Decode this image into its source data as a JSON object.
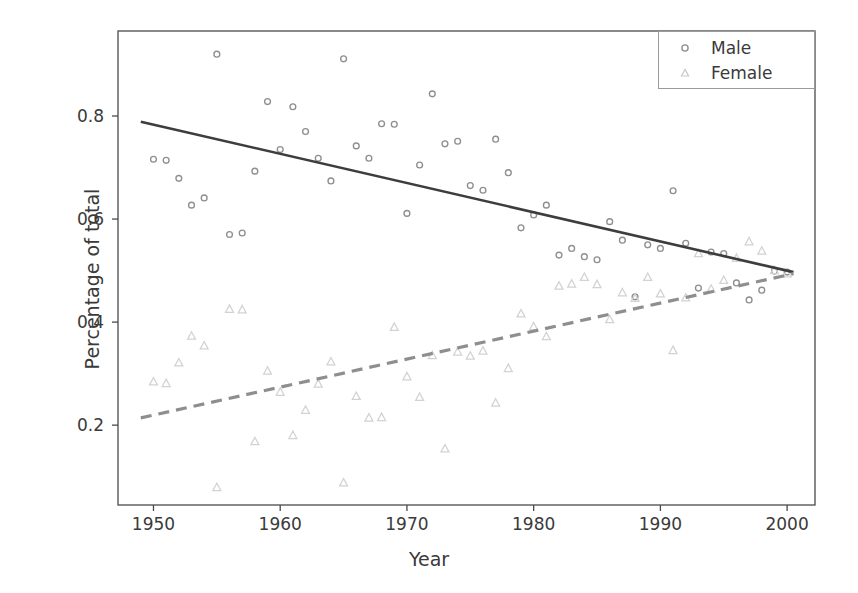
{
  "chart_data": {
    "type": "scatter",
    "title": "",
    "xlabel": "Year",
    "ylabel": "Percentage of total",
    "xlim": [
      1947.2,
      2002.2
    ],
    "ylim": [
      0.045,
      0.965
    ],
    "xticks": [
      1950,
      1960,
      1970,
      1980,
      1990,
      2000
    ],
    "xtick_labels": [
      "1950",
      "1960",
      "1970",
      "1980",
      "1990",
      "2000"
    ],
    "yticks": [
      0.2,
      0.4,
      0.6,
      0.8
    ],
    "ytick_labels": [
      "0.2",
      "0.4",
      "0.6",
      "0.8"
    ],
    "grid": false,
    "legend_position": "upper right",
    "series": [
      {
        "name": "Male",
        "marker": "circle-open",
        "marker_color": "#8e8e8e",
        "trend_style": "solid",
        "trend_color": "#3d3d3d",
        "trend_endpoints": [
          [
            1949.0,
            0.789
          ],
          [
            2000.5,
            0.497
          ]
        ],
        "points": [
          [
            1950,
            0.716
          ],
          [
            1951,
            0.714
          ],
          [
            1952,
            0.679
          ],
          [
            1953,
            0.627
          ],
          [
            1954,
            0.641
          ],
          [
            1955,
            0.92
          ],
          [
            1956,
            0.57
          ],
          [
            1957,
            0.573
          ],
          [
            1958,
            0.693
          ],
          [
            1959,
            0.828
          ],
          [
            1960,
            0.735
          ],
          [
            1961,
            0.818
          ],
          [
            1962,
            0.77
          ],
          [
            1963,
            0.718
          ],
          [
            1964,
            0.674
          ],
          [
            1965,
            0.911
          ],
          [
            1966,
            0.742
          ],
          [
            1967,
            0.718
          ],
          [
            1968,
            0.785
          ],
          [
            1969,
            0.784
          ],
          [
            1970,
            0.611
          ],
          [
            1971,
            0.705
          ],
          [
            1972,
            0.843
          ],
          [
            1973,
            0.746
          ],
          [
            1974,
            0.751
          ],
          [
            1975,
            0.665
          ],
          [
            1976,
            0.656
          ],
          [
            1977,
            0.755
          ],
          [
            1978,
            0.69
          ],
          [
            1979,
            0.583
          ],
          [
            1980,
            0.608
          ],
          [
            1981,
            0.627
          ],
          [
            1982,
            0.53
          ],
          [
            1983,
            0.543
          ],
          [
            1984,
            0.527
          ],
          [
            1985,
            0.521
          ],
          [
            1986,
            0.595
          ],
          [
            1987,
            0.559
          ],
          [
            1988,
            0.449
          ],
          [
            1989,
            0.55
          ],
          [
            1990,
            0.543
          ],
          [
            1991,
            0.655
          ],
          [
            1992,
            0.553
          ],
          [
            1993,
            0.466
          ],
          [
            1994,
            0.536
          ],
          [
            1995,
            0.533
          ],
          [
            1996,
            0.476
          ],
          [
            1997,
            0.443
          ],
          [
            1998,
            0.462
          ],
          [
            1999,
            0.499
          ],
          [
            2000,
            0.497
          ]
        ]
      },
      {
        "name": "Female",
        "marker": "triangle-open",
        "marker_color": "#d2d2d2",
        "trend_style": "dashed",
        "trend_color": "#8e8e8e",
        "trend_endpoints": [
          [
            1949.0,
            0.214
          ],
          [
            2000.5,
            0.494
          ]
        ],
        "points": [
          [
            1950,
            0.284
          ],
          [
            1951,
            0.281
          ],
          [
            1952,
            0.321
          ],
          [
            1953,
            0.373
          ],
          [
            1954,
            0.354
          ],
          [
            1955,
            0.079
          ],
          [
            1956,
            0.425
          ],
          [
            1957,
            0.424
          ],
          [
            1958,
            0.168
          ],
          [
            1959,
            0.305
          ],
          [
            1960,
            0.264
          ],
          [
            1961,
            0.18
          ],
          [
            1962,
            0.229
          ],
          [
            1963,
            0.28
          ],
          [
            1964,
            0.323
          ],
          [
            1965,
            0.088
          ],
          [
            1966,
            0.256
          ],
          [
            1967,
            0.214
          ],
          [
            1968,
            0.215
          ],
          [
            1969,
            0.39
          ],
          [
            1970,
            0.294
          ],
          [
            1971,
            0.254
          ],
          [
            1972,
            0.335
          ],
          [
            1973,
            0.154
          ],
          [
            1974,
            0.342
          ],
          [
            1975,
            0.334
          ],
          [
            1976,
            0.344
          ],
          [
            1977,
            0.243
          ],
          [
            1978,
            0.31
          ],
          [
            1979,
            0.416
          ],
          [
            1980,
            0.391
          ],
          [
            1981,
            0.372
          ],
          [
            1982,
            0.47
          ],
          [
            1983,
            0.474
          ],
          [
            1984,
            0.487
          ],
          [
            1985,
            0.473
          ],
          [
            1986,
            0.405
          ],
          [
            1987,
            0.457
          ],
          [
            1988,
            0.446
          ],
          [
            1989,
            0.487
          ],
          [
            1990,
            0.455
          ],
          [
            1991,
            0.345
          ],
          [
            1992,
            0.447
          ],
          [
            1993,
            0.533
          ],
          [
            1994,
            0.464
          ],
          [
            1995,
            0.481
          ],
          [
            1996,
            0.524
          ],
          [
            1997,
            0.556
          ],
          [
            1998,
            0.538
          ],
          [
            1999,
            0.5
          ],
          [
            2000,
            0.494
          ]
        ]
      }
    ],
    "legend_entries": [
      {
        "label": "Male",
        "marker": "circle-open"
      },
      {
        "label": "Female",
        "marker": "triangle-open"
      }
    ]
  },
  "colors": {
    "axis": "#4a4a4a",
    "text": "#3a3a3a",
    "male_marker": "#8e8e8e",
    "female_marker": "#d2d2d2",
    "male_line": "#3d3d3d",
    "female_line": "#8e8e8e",
    "background": "#ffffff"
  }
}
